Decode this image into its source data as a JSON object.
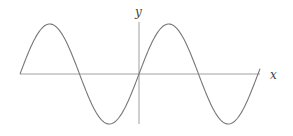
{
  "chart_data": {
    "type": "line",
    "title": "",
    "xlabel": "x",
    "ylabel": "y",
    "function": "y = sin(x)",
    "x_range_periods": [
      -2,
      2
    ],
    "x": [
      -6.283,
      -4.712,
      -3.142,
      -1.571,
      0,
      1.571,
      3.142,
      4.712,
      6.283
    ],
    "series": [
      {
        "name": "sine",
        "values": [
          0,
          1,
          0,
          -1,
          0,
          1,
          0,
          -1,
          0
        ]
      }
    ],
    "ylim": [
      -1,
      1
    ],
    "grid": false,
    "legend": null
  },
  "labels": {
    "x_axis": "x",
    "y_axis": "y"
  },
  "colors": {
    "curve": "#777777",
    "axis": "#999999",
    "label": "#444444"
  }
}
